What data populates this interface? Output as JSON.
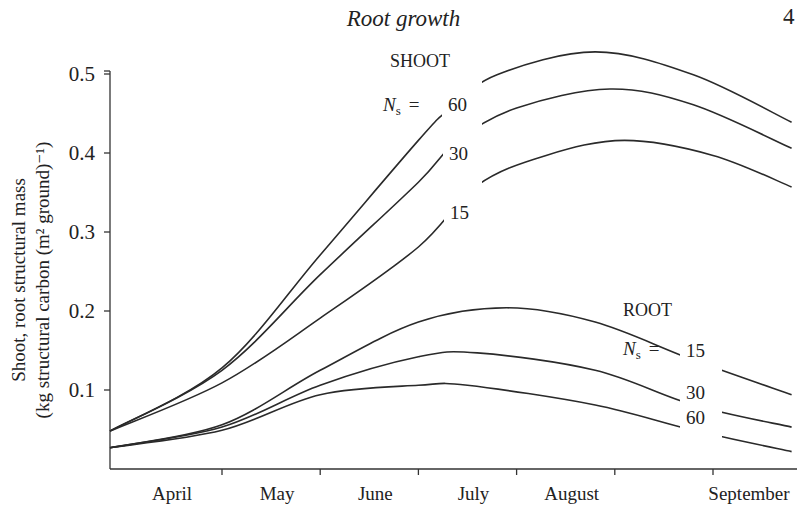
{
  "page": {
    "running_title": "Root growth",
    "page_number": "4"
  },
  "chart_data": {
    "type": "line",
    "title": "",
    "xlabel": "",
    "ylabel": "Shoot, root structural mass (kg structural carbon (m² ground)⁻¹)",
    "ylabel_line1": "Shoot, root structural mass",
    "ylabel_line2": "(kg structural carbon   (m² ground)⁻¹)",
    "ylim": [
      0,
      0.55
    ],
    "yticks": [
      0.1,
      0.2,
      0.3,
      0.4,
      0.5
    ],
    "ytick_labels": [
      "0.1",
      "0.2",
      "0.3",
      "0.4",
      "0.5"
    ],
    "categories": [
      "April",
      "May",
      "June",
      "July",
      "August",
      "September"
    ],
    "x_unit": "month (fractional, 0 = start of April, 6 = end of September)",
    "grid": false,
    "legend": "inline labels",
    "group_labels": [
      {
        "text": "SHOOT",
        "param": "N",
        "param_sub": "s",
        "eq": "="
      },
      {
        "text": "ROOT",
        "param": "N",
        "param_sub": "s",
        "eq": "="
      }
    ],
    "series": [
      {
        "name": "Shoot N_s = 60",
        "group": "SHOOT",
        "label": "60",
        "x": [
          0,
          1,
          2,
          3,
          3.3,
          3.8,
          4.8,
          5.8,
          6.8
        ],
        "values": [
          0.048,
          0.128,
          0.271,
          0.416,
          0.454,
          0.499,
          0.528,
          0.499,
          0.439
        ]
      },
      {
        "name": "Shoot N_s = 30",
        "group": "SHOOT",
        "label": "30",
        "x": [
          0,
          1,
          2,
          3,
          3.4,
          4.0,
          4.95,
          5.8,
          6.8
        ],
        "values": [
          0.048,
          0.125,
          0.246,
          0.363,
          0.416,
          0.457,
          0.481,
          0.461,
          0.406
        ]
      },
      {
        "name": "Shoot N_s = 15",
        "group": "SHOOT",
        "label": "15",
        "x": [
          0,
          1,
          2,
          3,
          3.6,
          4.3,
          5.1,
          6.0,
          6.8
        ],
        "values": [
          0.048,
          0.109,
          0.191,
          0.281,
          0.359,
          0.397,
          0.416,
          0.397,
          0.357
        ]
      },
      {
        "name": "Root N_s = 15",
        "group": "ROOT",
        "label": "15",
        "x": [
          0,
          1,
          2,
          3,
          3.9,
          4.8,
          5.8,
          6.8
        ],
        "values": [
          0.027,
          0.056,
          0.125,
          0.186,
          0.204,
          0.186,
          0.138,
          0.094
        ]
      },
      {
        "name": "Root N_s = 30",
        "group": "ROOT",
        "label": "30",
        "x": [
          0,
          1,
          2,
          3,
          3.6,
          4.8,
          5.8,
          6.8
        ],
        "values": [
          0.027,
          0.053,
          0.106,
          0.142,
          0.147,
          0.125,
          0.081,
          0.053
        ]
      },
      {
        "name": "Root N_s = 60",
        "group": "ROOT",
        "label": "60",
        "x": [
          0,
          1,
          2,
          3,
          3.5,
          4.8,
          5.8,
          6.8
        ],
        "values": [
          0.027,
          0.049,
          0.094,
          0.106,
          0.106,
          0.081,
          0.049,
          0.022
        ]
      }
    ]
  }
}
